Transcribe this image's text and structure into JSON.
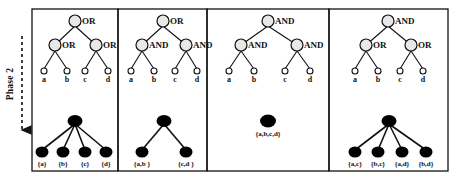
{
  "figure": {
    "phase": {
      "label": "Phase 2",
      "arrow_direction": "down",
      "arrow_style": "dashed"
    },
    "colors": {
      "stroke": "#111111",
      "internal_node_fill": "#e8e8e8",
      "leaf_node_fill": "#ffffff",
      "result_node_fill": "#000000",
      "panel_border": "#111111",
      "background": "#ffffff"
    },
    "panels": [
      {
        "id": "panel-1",
        "tree": {
          "root": {
            "label": "OR"
          },
          "mid": [
            {
              "label": "OR"
            },
            {
              "label": "OR"
            }
          ],
          "leaves": [
            {
              "label": "a"
            },
            {
              "label": "b"
            },
            {
              "label": "c"
            },
            {
              "label": "d"
            }
          ]
        },
        "result": {
          "root": {
            "label": ""
          },
          "children": [
            {
              "label": "{a}"
            },
            {
              "label": "{b}"
            },
            {
              "label": "{c}"
            },
            {
              "label": "{d}"
            }
          ]
        }
      },
      {
        "id": "panel-2",
        "tree": {
          "root": {
            "label": "OR"
          },
          "mid": [
            {
              "label": "AND"
            },
            {
              "label": "AND"
            }
          ],
          "leaves": [
            {
              "label": "a"
            },
            {
              "label": "b"
            },
            {
              "label": "c"
            },
            {
              "label": "d"
            }
          ]
        },
        "result": {
          "root": {
            "label": ""
          },
          "children": [
            {
              "label": "{a,b }"
            },
            {
              "label": "{c,d }"
            }
          ]
        }
      },
      {
        "id": "panel-3",
        "tree": {
          "root": {
            "label": "AND"
          },
          "mid": [
            {
              "label": "AND"
            },
            {
              "label": "AND"
            }
          ],
          "leaves": [
            {
              "label": "a"
            },
            {
              "label": "b"
            },
            {
              "label": "c"
            },
            {
              "label": "d"
            }
          ]
        },
        "result": {
          "root": {
            "label": "{a,b,c,d}"
          },
          "children": []
        }
      },
      {
        "id": "panel-4",
        "tree": {
          "root": {
            "label": "AND"
          },
          "mid": [
            {
              "label": "OR"
            },
            {
              "label": "OR"
            }
          ],
          "leaves": [
            {
              "label": "a"
            },
            {
              "label": "b"
            },
            {
              "label": "c"
            },
            {
              "label": "d"
            }
          ]
        },
        "result": {
          "root": {
            "label": ""
          },
          "children": [
            {
              "label": "{a,c}"
            },
            {
              "label": "{b,c}"
            },
            {
              "label": "{a,d}"
            },
            {
              "label": "{b,d}"
            }
          ]
        }
      }
    ]
  }
}
